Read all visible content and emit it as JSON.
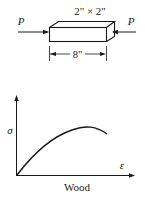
{
  "specimen": {
    "cross_section_label": "2\" × 2\"",
    "length_label": "8\"",
    "load_left_label": "P",
    "load_right_label": "P"
  },
  "graph": {
    "y_axis_label": "σ",
    "x_axis_label": "ε",
    "caption": "Wood"
  },
  "colors": {
    "ink": "#1a1a1a",
    "background": "#ffffff"
  }
}
